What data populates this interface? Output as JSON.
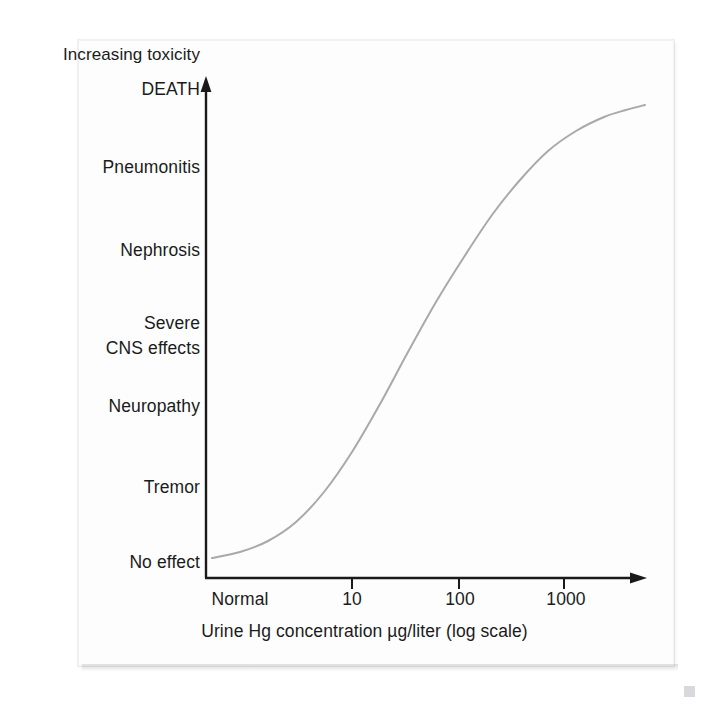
{
  "figure": {
    "type": "scanned-figure-panel",
    "background_color": "#ffffff",
    "panel_color": "#fdfdfd"
  },
  "chart_data": {
    "type": "line",
    "title": "",
    "subtitle": "",
    "xlabel": "Urine Hg concentration µg/liter (log scale)",
    "ylabel": "Increasing toxicity",
    "grid": false,
    "legend": "none",
    "axis_style": "arrow-headed open axes",
    "x_scale": "log",
    "x_tick_labels": [
      "Normal",
      "10",
      "100",
      "1000"
    ],
    "x_tick_has_mark": [
      false,
      true,
      true,
      true
    ],
    "x_tick_px": [
      240,
      352,
      459,
      564
    ],
    "y_tick_labels": [
      "DEATH",
      "Pneumonitis",
      "Nephrosis",
      "Severe CNS effects",
      "Neuropathy",
      "Tremor",
      "No effect"
    ],
    "y_tick_px": [
      90,
      168,
      251,
      334,
      407,
      488,
      563
    ],
    "series": [
      {
        "name": "Toxicity vs urine Hg concentration",
        "color": "#a9a9a9",
        "line_width": 2,
        "points": [
          {
            "x": 212,
            "y": 558
          },
          {
            "x": 240,
            "y": 552
          },
          {
            "x": 268,
            "y": 541
          },
          {
            "x": 296,
            "y": 522
          },
          {
            "x": 324,
            "y": 492
          },
          {
            "x": 352,
            "y": 452
          },
          {
            "x": 380,
            "y": 404
          },
          {
            "x": 408,
            "y": 352
          },
          {
            "x": 436,
            "y": 302
          },
          {
            "x": 464,
            "y": 257
          },
          {
            "x": 492,
            "y": 215
          },
          {
            "x": 520,
            "y": 180
          },
          {
            "x": 548,
            "y": 151
          },
          {
            "x": 576,
            "y": 131
          },
          {
            "x": 604,
            "y": 117
          },
          {
            "x": 626,
            "y": 110
          },
          {
            "x": 645,
            "y": 105
          }
        ]
      }
    ],
    "annotations": [
      {
        "text": "Increasing toxicity",
        "position": "above-y-axis"
      }
    ]
  },
  "axes": {
    "y_axis_label_top": "Increasing toxicity",
    "x_axis_title": "Urine Hg concentration µg/liter (log scale)",
    "y_labels": {
      "death": "DEATH",
      "pneumonitis": "Pneumonitis",
      "nephrosis": "Nephrosis",
      "severe": "Severe",
      "cns_effects": "CNS effects",
      "neuropathy": "Neuropathy",
      "tremor": "Tremor",
      "no_effect": "No effect"
    },
    "x_labels": {
      "normal": "Normal",
      "ten": "10",
      "hundred": "100",
      "thousand": "1000"
    }
  },
  "colors": {
    "curve": "#a9a9a9",
    "axis": "#1a1a1a",
    "text": "#1b1b1b"
  }
}
